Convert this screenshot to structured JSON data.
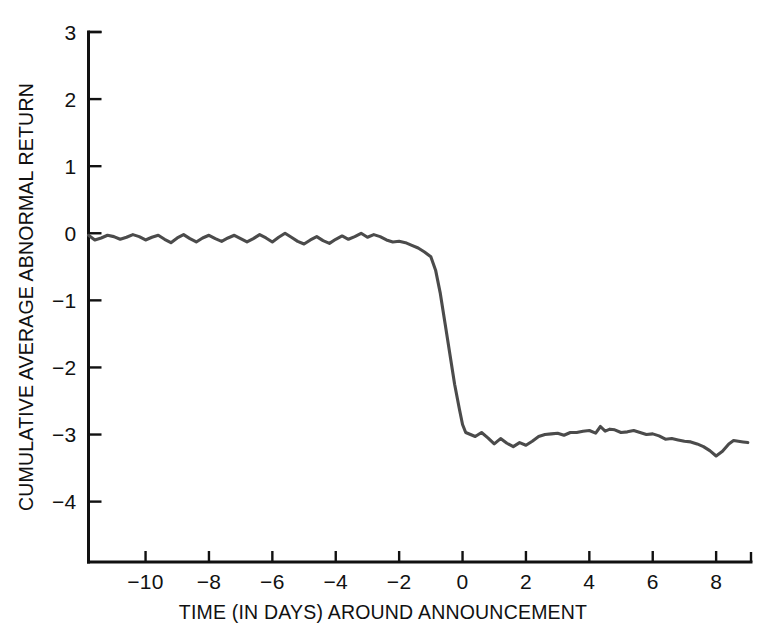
{
  "chart_data": {
    "type": "line",
    "title": "",
    "xlabel": "TIME (IN DAYS) AROUND ANNOUNCEMENT",
    "ylabel": "CUMULATIVE AVERAGE ABNORMAL RETURN",
    "xlim": [
      -11.8,
      9.1
    ],
    "ylim": [
      -4.9,
      3.0
    ],
    "xticks": [
      -10,
      -8,
      -6,
      -4,
      -2,
      0,
      2,
      4,
      6,
      8
    ],
    "xtick_labels": [
      "−10",
      "−8",
      "−6",
      "−4",
      "−2",
      "0",
      "2",
      "4",
      "6",
      "8"
    ],
    "yticks": [
      3,
      2,
      1,
      0,
      -1,
      -2,
      -3,
      -4
    ],
    "ytick_labels": [
      "3",
      "2",
      "1",
      "0",
      "−1",
      "−2",
      "−3",
      "−4"
    ],
    "grid": false,
    "legend": "none",
    "line_color": "#4b4b4b",
    "axis_color": "#111111",
    "background_color": "#ffffff",
    "series": [
      {
        "name": "Cumulative average abnormal return",
        "x": [
          -11.8,
          -11.6,
          -11.4,
          -11.2,
          -11.0,
          -10.8,
          -10.6,
          -10.4,
          -10.2,
          -10.0,
          -9.8,
          -9.6,
          -9.4,
          -9.2,
          -9.0,
          -8.8,
          -8.6,
          -8.4,
          -8.2,
          -8.0,
          -7.8,
          -7.6,
          -7.4,
          -7.2,
          -7.0,
          -6.8,
          -6.6,
          -6.4,
          -6.2,
          -6.0,
          -5.8,
          -5.6,
          -5.4,
          -5.2,
          -5.0,
          -4.8,
          -4.6,
          -4.4,
          -4.2,
          -4.0,
          -3.8,
          -3.6,
          -3.4,
          -3.2,
          -3.0,
          -2.8,
          -2.6,
          -2.4,
          -2.2,
          -2.0,
          -1.8,
          -1.6,
          -1.4,
          -1.2,
          -1.0,
          -0.85,
          -0.7,
          -0.55,
          -0.4,
          -0.25,
          -0.1,
          0.0,
          0.1,
          0.25,
          0.4,
          0.6,
          0.8,
          1.0,
          1.2,
          1.4,
          1.6,
          1.8,
          2.0,
          2.2,
          2.4,
          2.6,
          2.8,
          3.0,
          3.2,
          3.4,
          3.6,
          3.8,
          4.0,
          4.2,
          4.35,
          4.5,
          4.65,
          4.8,
          5.0,
          5.2,
          5.4,
          5.6,
          5.8,
          6.0,
          6.2,
          6.4,
          6.6,
          6.8,
          7.0,
          7.2,
          7.4,
          7.6,
          7.8,
          8.0,
          8.2,
          8.4,
          8.55,
          8.7,
          8.85,
          9.0
        ],
        "values": [
          -0.03,
          -0.1,
          -0.07,
          -0.03,
          -0.05,
          -0.09,
          -0.06,
          -0.02,
          -0.05,
          -0.1,
          -0.06,
          -0.03,
          -0.09,
          -0.14,
          -0.07,
          -0.02,
          -0.08,
          -0.13,
          -0.07,
          -0.03,
          -0.08,
          -0.12,
          -0.07,
          -0.03,
          -0.08,
          -0.13,
          -0.08,
          -0.02,
          -0.07,
          -0.13,
          -0.06,
          0.0,
          -0.06,
          -0.12,
          -0.16,
          -0.1,
          -0.05,
          -0.11,
          -0.15,
          -0.09,
          -0.04,
          -0.09,
          -0.05,
          0.0,
          -0.06,
          -0.02,
          -0.05,
          -0.1,
          -0.13,
          -0.12,
          -0.14,
          -0.18,
          -0.22,
          -0.28,
          -0.35,
          -0.55,
          -0.9,
          -1.35,
          -1.8,
          -2.25,
          -2.62,
          -2.85,
          -2.97,
          -3.0,
          -3.03,
          -2.97,
          -3.05,
          -3.14,
          -3.06,
          -3.13,
          -3.18,
          -3.12,
          -3.16,
          -3.1,
          -3.03,
          -3.0,
          -2.99,
          -2.98,
          -3.01,
          -2.97,
          -2.97,
          -2.95,
          -2.94,
          -2.98,
          -2.88,
          -2.95,
          -2.92,
          -2.93,
          -2.97,
          -2.96,
          -2.94,
          -2.97,
          -3.0,
          -2.99,
          -3.02,
          -3.07,
          -3.06,
          -3.08,
          -3.1,
          -3.11,
          -3.14,
          -3.18,
          -3.24,
          -3.32,
          -3.25,
          -3.14,
          -3.09,
          -3.1,
          -3.11,
          -3.12
        ]
      }
    ]
  },
  "axes": {
    "x_title": "TIME (IN DAYS) AROUND ANNOUNCEMENT",
    "y_title": "CUMULATIVE AVERAGE ABNORMAL RETURN"
  }
}
